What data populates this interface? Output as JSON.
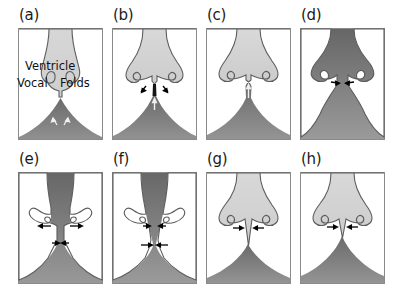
{
  "figure": {
    "type": "scientific-diagram",
    "width": 398,
    "height": 296,
    "background_color": "#ffffff",
    "rows": 2,
    "columns": 4
  },
  "colors": {
    "tissue_light": "#d2d2d2",
    "tissue_light_edge": "#6f6f6f",
    "airway_dark_top": "#6d6d6d",
    "airway_dark_bottom": "#8f8f8f",
    "frame_stroke": "#8a8a8a",
    "outline_stroke": "#4a4a4a",
    "arrow_black": "#000000",
    "arrow_white": "#f2f2f2",
    "label_text": "#1a1a1a"
  },
  "annotations": {
    "ventricle": "Ventricle",
    "vocal": "Vocal",
    "folds": "Folds"
  },
  "panels": [
    {
      "id": "a",
      "label": "(a)",
      "row": 1,
      "column": 1,
      "x": 18,
      "y": 28,
      "w": 85,
      "h": 112,
      "state": "closed",
      "glottis_open": false,
      "subglottal_pressure_arrows": "white-diverging-pair",
      "has_text_labels": true,
      "arrows": [
        {
          "name": "subglottal-flow-left",
          "style": "white",
          "direction": "down-left"
        },
        {
          "name": "subglottal-flow-right",
          "style": "white",
          "direction": "down-right"
        }
      ]
    },
    {
      "id": "b",
      "label": "(b)",
      "row": 1,
      "column": 2,
      "x": 112,
      "y": 28,
      "w": 85,
      "h": 112,
      "state": "opening-lower-margin",
      "glottis_open": false,
      "arrows": [
        {
          "name": "tissue-motion-left",
          "style": "black",
          "direction": "out-left"
        },
        {
          "name": "tissue-motion-right",
          "style": "black",
          "direction": "out-right"
        },
        {
          "name": "airflow-up",
          "style": "white",
          "direction": "up"
        }
      ]
    },
    {
      "id": "c",
      "label": "(c)",
      "row": 1,
      "column": 3,
      "x": 206,
      "y": 28,
      "w": 85,
      "h": 112,
      "state": "opening-channel-forming",
      "glottis_open": true,
      "arrows": [
        {
          "name": "airflow-up",
          "style": "white",
          "direction": "up"
        }
      ]
    },
    {
      "id": "d",
      "label": "(d)",
      "row": 1,
      "column": 4,
      "x": 300,
      "y": 28,
      "w": 85,
      "h": 112,
      "state": "maximum-open",
      "glottis_open": true,
      "arrows": [
        {
          "name": "tissue-motion-left",
          "style": "black",
          "direction": "in-left"
        },
        {
          "name": "tissue-motion-right",
          "style": "black",
          "direction": "in-right"
        }
      ]
    },
    {
      "id": "e",
      "label": "(e)",
      "row": 2,
      "column": 1,
      "x": 18,
      "y": 172,
      "w": 85,
      "h": 112,
      "state": "upper-margin-open-lower-closing",
      "glottis_open": true,
      "arrows": [
        {
          "name": "upper-margin-left",
          "style": "black",
          "direction": "out-left"
        },
        {
          "name": "upper-margin-right",
          "style": "black",
          "direction": "out-right"
        },
        {
          "name": "lower-margin-left",
          "style": "black",
          "direction": "in-right"
        },
        {
          "name": "lower-margin-right",
          "style": "black",
          "direction": "in-left"
        }
      ]
    },
    {
      "id": "f",
      "label": "(f)",
      "row": 2,
      "column": 2,
      "x": 112,
      "y": 172,
      "w": 85,
      "h": 112,
      "state": "converging-closing",
      "glottis_open": true,
      "arrows": [
        {
          "name": "upper-margin-left",
          "style": "black",
          "direction": "in-right"
        },
        {
          "name": "upper-margin-right",
          "style": "black",
          "direction": "in-left"
        },
        {
          "name": "lower-margin-left",
          "style": "black",
          "direction": "in-right"
        },
        {
          "name": "lower-margin-right",
          "style": "black",
          "direction": "in-left"
        }
      ]
    },
    {
      "id": "g",
      "label": "(g)",
      "row": 2,
      "column": 3,
      "x": 206,
      "y": 172,
      "w": 85,
      "h": 112,
      "state": "nearly-closed",
      "glottis_open": false,
      "arrows": [
        {
          "name": "closure-left",
          "style": "black",
          "direction": "in-right"
        },
        {
          "name": "closure-right",
          "style": "black",
          "direction": "in-left"
        }
      ]
    },
    {
      "id": "h",
      "label": "(h)",
      "row": 2,
      "column": 4,
      "x": 300,
      "y": 172,
      "w": 85,
      "h": 112,
      "state": "closed",
      "glottis_open": false,
      "arrows": [
        {
          "name": "closure-left",
          "style": "black",
          "direction": "in-right"
        },
        {
          "name": "closure-right",
          "style": "black",
          "direction": "in-left"
        }
      ]
    }
  ]
}
